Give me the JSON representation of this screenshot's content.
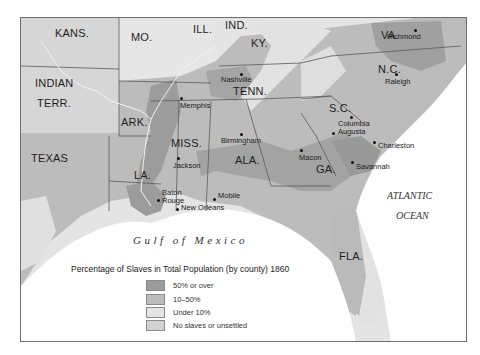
{
  "map": {
    "title": "Percentage of Slaves in Total Population (by county) 1860",
    "states": [
      {
        "id": "kans",
        "label": "KANS."
      },
      {
        "id": "mo",
        "label": "MO."
      },
      {
        "id": "ill",
        "label": "ILL."
      },
      {
        "id": "ind",
        "label": "IND."
      },
      {
        "id": "ky",
        "label": "KY."
      },
      {
        "id": "va",
        "label": "VA."
      },
      {
        "id": "indian-terr-1",
        "label": "INDIAN"
      },
      {
        "id": "indian-terr-2",
        "label": "TERR."
      },
      {
        "id": "tenn",
        "label": "TENN."
      },
      {
        "id": "nc",
        "label": "N.C."
      },
      {
        "id": "ark",
        "label": "ARK."
      },
      {
        "id": "sc",
        "label": "S.C."
      },
      {
        "id": "miss",
        "label": "MISS."
      },
      {
        "id": "ala",
        "label": "ALA."
      },
      {
        "id": "ga",
        "label": "GA."
      },
      {
        "id": "texas",
        "label": "TEXAS"
      },
      {
        "id": "la",
        "label": "LA."
      },
      {
        "id": "fla",
        "label": "FLA."
      }
    ],
    "cities": [
      {
        "id": "richmond",
        "label": "Richmond"
      },
      {
        "id": "nashville",
        "label": "Nashville"
      },
      {
        "id": "raleigh",
        "label": "Raleigh"
      },
      {
        "id": "memphis",
        "label": "Memphis"
      },
      {
        "id": "columbia",
        "label": "Columbia"
      },
      {
        "id": "augusta",
        "label": "Augusta"
      },
      {
        "id": "birmingham",
        "label": "Birmingham"
      },
      {
        "id": "charleston",
        "label": "Charleston"
      },
      {
        "id": "jackson",
        "label": "Jackson"
      },
      {
        "id": "macon",
        "label": "Macon"
      },
      {
        "id": "savannah",
        "label": "Savannah"
      },
      {
        "id": "baton-rouge-1",
        "label": "Baton"
      },
      {
        "id": "baton-rouge-2",
        "label": "Rouge"
      },
      {
        "id": "mobile",
        "label": "Mobile"
      },
      {
        "id": "new-orleans",
        "label": "New Orleans"
      }
    ],
    "water": {
      "gulf": "Gulf of Mexico",
      "atlantic_1": "ATLANTIC",
      "atlantic_2": "OCEAN"
    },
    "colors": {
      "over_50": "#9c9c9c",
      "10_50": "#bcbcbc",
      "under_10": "#e4e4e4",
      "none": "#d2d2d2",
      "water": "#ffffff",
      "border": "#5a5a5a"
    }
  },
  "legend": {
    "title": "Percentage of Slaves in Total Population (by county) 1860",
    "items": [
      {
        "label": "50% or over",
        "color": "#9c9c9c"
      },
      {
        "label": "10–50%",
        "color": "#bcbcbc"
      },
      {
        "label": "Under 10%",
        "color": "#e4e4e4"
      },
      {
        "label": "No slaves or unsettled",
        "color": "#d2d2d2"
      }
    ]
  }
}
